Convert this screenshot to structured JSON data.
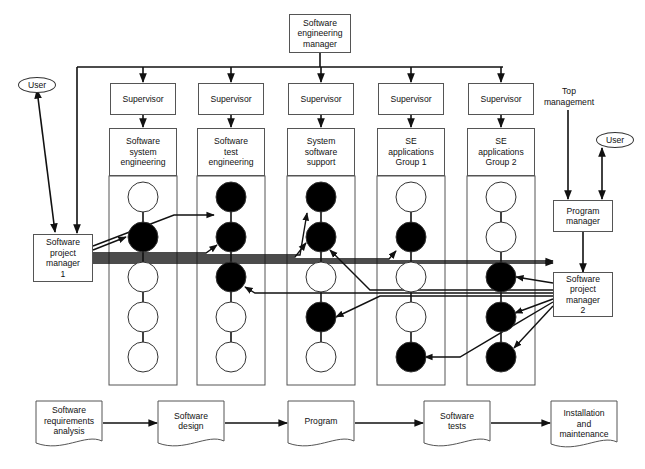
{
  "top_manager": {
    "label": "Software\nengineering\nmanager"
  },
  "supervisors": [
    {
      "label": "Supervisor"
    },
    {
      "label": "Supervisor"
    },
    {
      "label": "Supervisor"
    },
    {
      "label": "Supervisor"
    },
    {
      "label": "Supervisor"
    }
  ],
  "departments": [
    {
      "label": "Software\nsystem\nengineering",
      "staff": [
        false,
        true,
        false,
        false,
        false
      ]
    },
    {
      "label": "Software\ntest\nengineering",
      "staff": [
        true,
        true,
        true,
        false,
        false
      ]
    },
    {
      "label": "System\nsoftware\nsupport",
      "staff": [
        true,
        true,
        false,
        true,
        false
      ]
    },
    {
      "label": "SE\napplications\nGroup 1",
      "staff": [
        false,
        true,
        false,
        false,
        true
      ]
    },
    {
      "label": "SE\napplications\nGroup 2",
      "staff": [
        false,
        false,
        true,
        true,
        true
      ]
    }
  ],
  "user_left": {
    "label": "User"
  },
  "user_right": {
    "label": "User"
  },
  "top_management": {
    "label": "Top\nmanagement"
  },
  "program_manager": {
    "label": "Program\nmanager"
  },
  "project_manager_1": {
    "label": "Software\nproject\nmanager\n1"
  },
  "project_manager_2": {
    "label": "Software\nproject\nmanager\n2"
  },
  "lifecycle": [
    {
      "label": "Software\nrequirements\nanalysis"
    },
    {
      "label": "Software\ndesign"
    },
    {
      "label": "Program"
    },
    {
      "label": "Software\ntests"
    },
    {
      "label": "Installation\nand\nmaintenance"
    }
  ],
  "colors": {
    "line": "#111111",
    "box_border": "#555555",
    "filled_staff": "#000000",
    "empty_staff": "#ffffff"
  }
}
